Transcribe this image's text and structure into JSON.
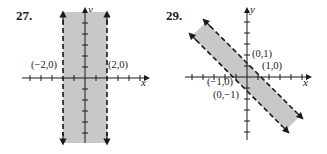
{
  "problems": [
    {
      "number": "27.",
      "axes": {
        "x": "x",
        "y": "y"
      },
      "points": [
        "(−2,0)",
        "(2,0)"
      ],
      "region": "vertical strip between dashed lines x = −2 and x = 2, shaded"
    },
    {
      "number": "29.",
      "axes": {
        "x": "x",
        "y": "y"
      },
      "points": [
        "(0,1)",
        "(1,0)",
        "(−1,0)",
        "(0,−1)"
      ],
      "region": "diagonal strip between dashed lines x + y = 1 and x + y = −1, shaded"
    }
  ],
  "colors": {
    "shade": "#c8c8c8",
    "ink": "#1a1a1a"
  }
}
